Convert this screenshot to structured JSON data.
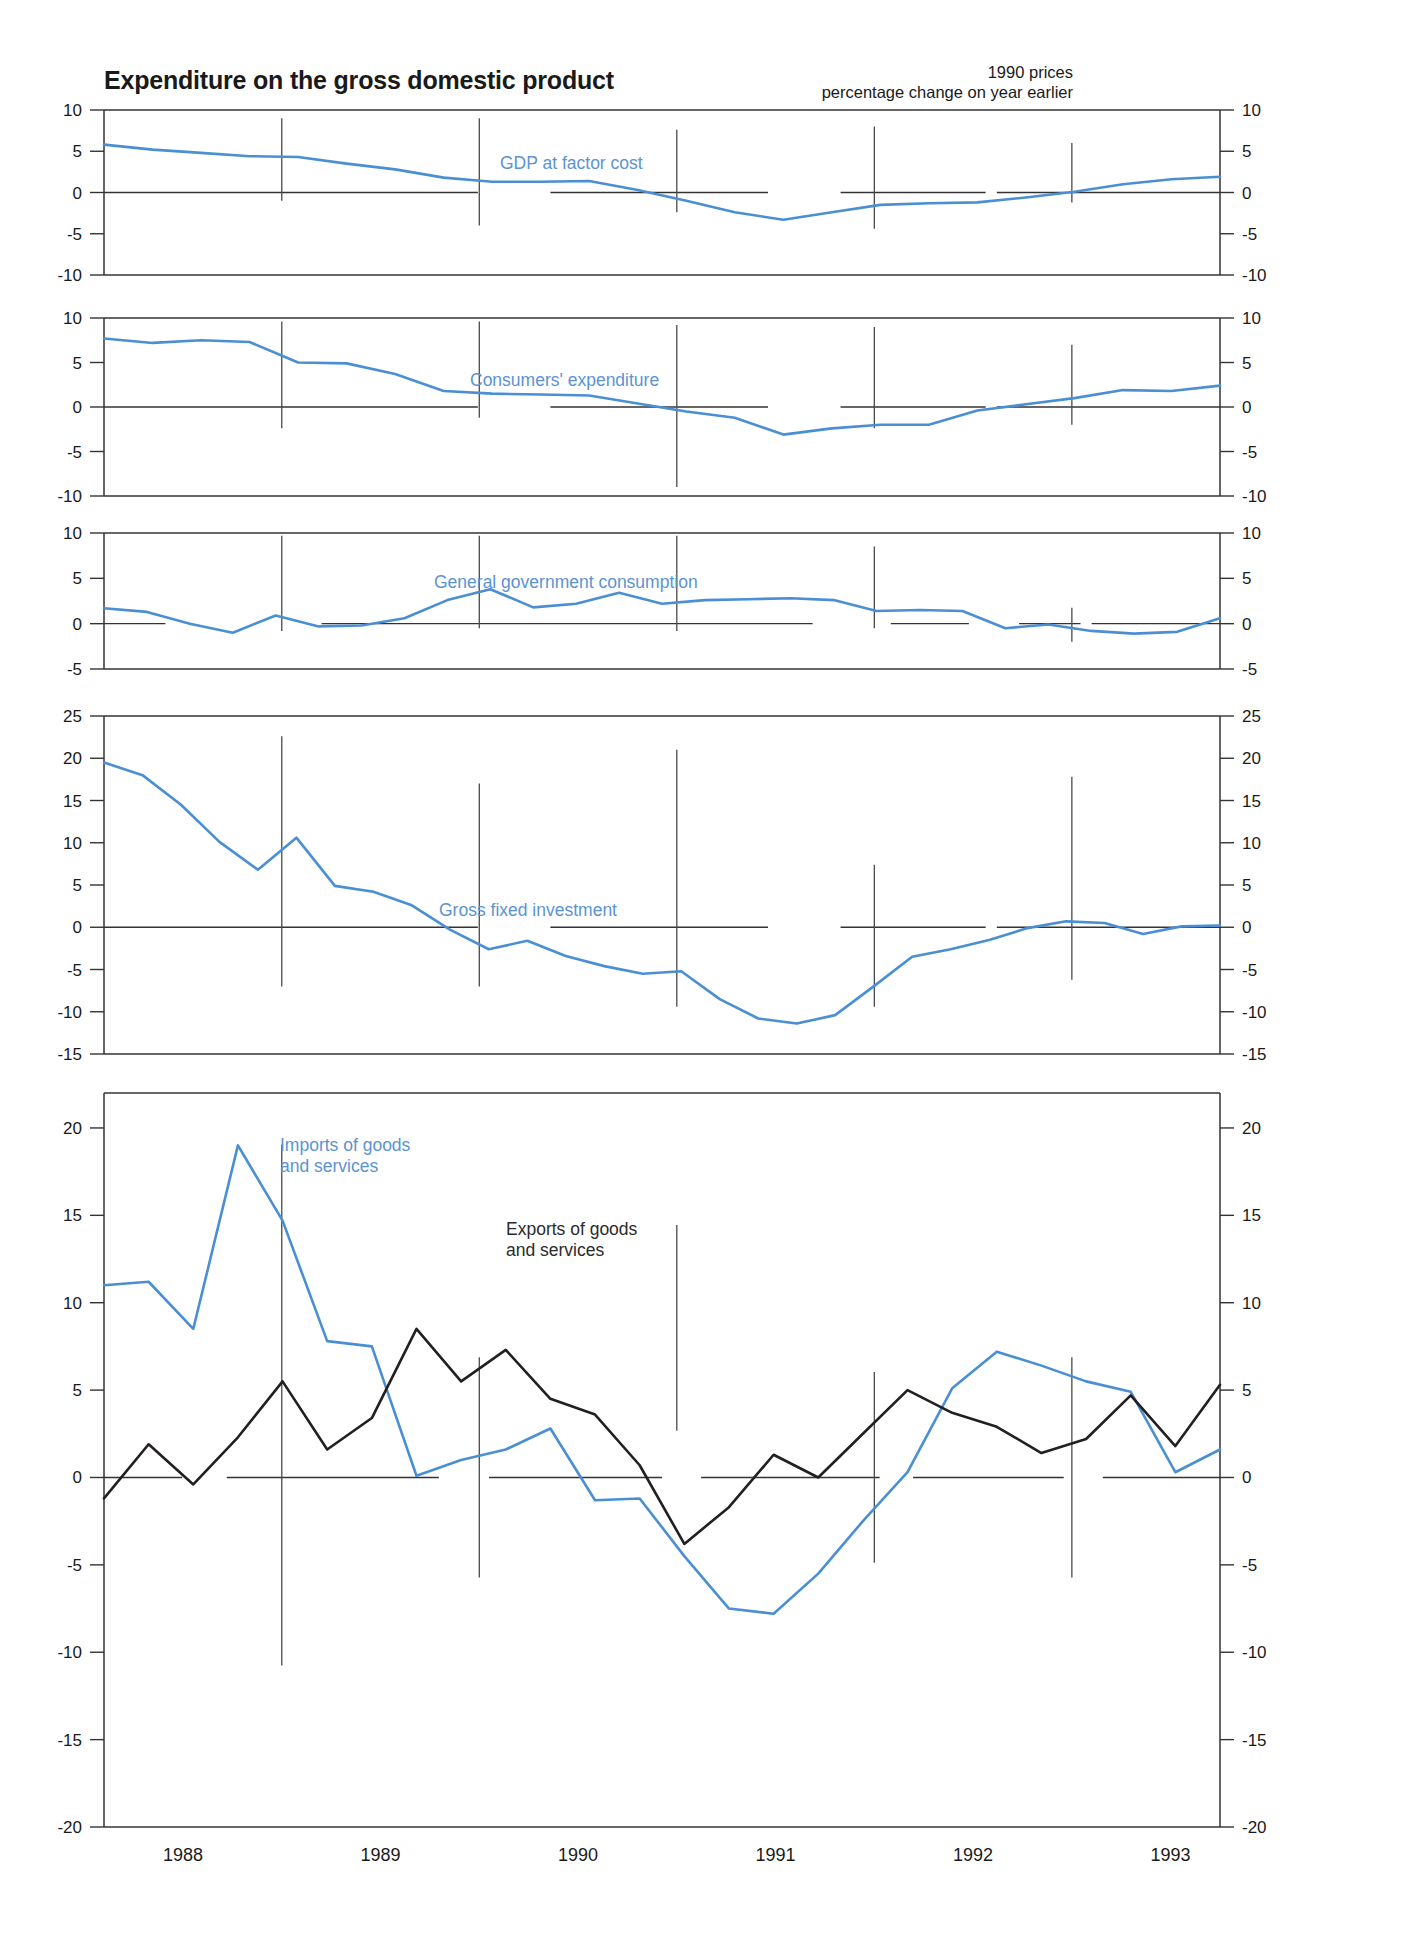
{
  "header": {
    "title": "Expenditure on the gross domestic product",
    "unit_line1": "1990 prices",
    "unit_line2": "percentage change on year earlier"
  },
  "axis": {
    "x_tick_labels": [
      "1988",
      "1989",
      "1990",
      "1991",
      "1992",
      "1993"
    ],
    "x_tick_values": [
      1988,
      1989,
      1990,
      1991,
      1992,
      1993
    ]
  },
  "colors": {
    "series_blue": "#4a8fd4",
    "series_black": "#231f20",
    "axis": "#333333",
    "label_blue": "#5b93d3"
  },
  "chart_data": {
    "type": "line",
    "title": "Expenditure on the gross domestic product",
    "subtitle": "1990 prices, percentage change on year earlier",
    "xlabel": "",
    "ylabel": "percentage change on year earlier",
    "xlim": [
      1987.6,
      1993.25
    ],
    "grid": false,
    "legend_position": "inline-annotation",
    "x_tick_labels": [
      "1988",
      "1989",
      "1990",
      "1991",
      "1992",
      "1993"
    ],
    "panels": [
      {
        "name": "gdp-at-factor-cost",
        "label": "GDP at factor cost",
        "label_color": "#5b93d3",
        "ylim": [
          -10,
          10
        ],
        "yticks": [
          -10,
          -5,
          0,
          5,
          10
        ],
        "series": [
          {
            "name": "GDP at factor cost",
            "color": "#4a8fd4",
            "x": [
              1987.6,
              1987.85,
              1988.1,
              1988.35,
              1988.6,
              1988.85,
              1989.1,
              1989.35,
              1989.6,
              1989.85,
              1990.1,
              1990.35,
              1990.6,
              1990.85,
              1991.1,
              1991.35,
              1991.6,
              1991.85,
              1992.1,
              1992.35,
              1992.6,
              1992.85,
              1993.1
            ],
            "values": [
              5.8,
              5.2,
              4.8,
              4.4,
              4.3,
              3.5,
              2.8,
              1.8,
              1.3,
              1.3,
              1.4,
              0.3,
              -1.0,
              -2.4,
              -3.3,
              -2.4,
              -1.5,
              -1.3,
              -1.2,
              -0.6,
              0.1,
              1.0,
              1.6,
              1.9
            ]
          }
        ]
      },
      {
        "name": "consumers-expenditure",
        "label": "Consumers' expenditure",
        "label_color": "#5b93d3",
        "ylim": [
          -10,
          10
        ],
        "yticks": [
          -10,
          -5,
          0,
          5,
          10
        ],
        "series": [
          {
            "name": "Consumers' expenditure",
            "color": "#4a8fd4",
            "x": [
              1987.6,
              1987.85,
              1988.1,
              1988.35,
              1988.6,
              1988.85,
              1989.1,
              1989.35,
              1989.6,
              1989.85,
              1990.1,
              1990.35,
              1990.6,
              1990.85,
              1991.1,
              1991.35,
              1991.6,
              1991.85,
              1992.1,
              1992.35,
              1992.6,
              1992.85,
              1993.1
            ],
            "values": [
              7.7,
              7.2,
              7.5,
              7.3,
              5.0,
              4.9,
              3.7,
              1.8,
              1.5,
              1.4,
              1.3,
              0.4,
              -0.5,
              -1.2,
              -3.1,
              -2.4,
              -2.0,
              -2.0,
              -0.4,
              0.3,
              1.0,
              1.9,
              1.8,
              2.4
            ]
          }
        ]
      },
      {
        "name": "general-government-consumption",
        "label": "General government consumption",
        "label_color": "#5b93d3",
        "ylim": [
          -5,
          10
        ],
        "yticks": [
          -5,
          0,
          5,
          10
        ],
        "series": [
          {
            "name": "General government consumption",
            "color": "#4a8fd4",
            "x": [
              1987.6,
              1987.85,
              1988.1,
              1988.35,
              1988.6,
              1988.85,
              1989.1,
              1989.35,
              1989.6,
              1989.85,
              1990.1,
              1990.35,
              1990.6,
              1990.85,
              1991.1,
              1991.35,
              1991.6,
              1991.85,
              1992.1,
              1992.35,
              1992.6,
              1992.85,
              1993.1
            ],
            "values": [
              1.7,
              1.3,
              0.0,
              -1.0,
              0.9,
              -0.3,
              -0.2,
              0.6,
              2.6,
              3.8,
              1.8,
              2.2,
              3.4,
              2.2,
              2.6,
              2.7,
              2.8,
              2.6,
              1.4,
              1.5,
              1.4,
              -0.5,
              -0.1,
              -0.8,
              -1.1,
              -0.9,
              0.6
            ]
          }
        ]
      },
      {
        "name": "gross-fixed-investment",
        "label": "Gross fixed investment",
        "label_color": "#5b93d3",
        "ylim": [
          -15,
          25
        ],
        "yticks": [
          -15,
          -10,
          -5,
          0,
          5,
          10,
          15,
          20,
          25
        ],
        "series": [
          {
            "name": "Gross fixed investment",
            "color": "#4a8fd4",
            "x": [
              1987.6,
              1987.85,
              1988.1,
              1988.35,
              1988.6,
              1988.85,
              1989.1,
              1989.35,
              1989.6,
              1989.85,
              1990.1,
              1990.35,
              1990.6,
              1990.85,
              1991.1,
              1991.35,
              1991.6,
              1991.85,
              1992.1,
              1992.35,
              1992.6,
              1992.85,
              1993.1
            ],
            "values": [
              19.5,
              18.0,
              14.5,
              10.1,
              6.8,
              10.6,
              4.9,
              4.2,
              2.6,
              -0.3,
              -2.6,
              -1.6,
              -3.4,
              -4.6,
              -5.5,
              -5.2,
              -8.5,
              -10.8,
              -11.4,
              -10.4,
              -7.0,
              -3.5,
              -2.6,
              -1.5,
              -0.1,
              0.7,
              0.5,
              -0.8,
              0.1,
              0.2
            ]
          }
        ]
      },
      {
        "name": "trade-in-goods-and-services",
        "label_imports": "Imports of goods\nand services",
        "label_exports": "Exports of goods\nand services",
        "ylim": [
          -20,
          22
        ],
        "yticks": [
          -20,
          -15,
          -10,
          -5,
          0,
          5,
          10,
          15,
          20
        ],
        "series": [
          {
            "name": "Imports of goods and services",
            "color": "#4a8fd4",
            "x": [
              1987.6,
              1987.85,
              1988.1,
              1988.35,
              1988.6,
              1988.85,
              1989.1,
              1989.35,
              1989.6,
              1989.85,
              1990.1,
              1990.35,
              1990.6,
              1990.85,
              1991.1,
              1991.35,
              1991.6,
              1991.85,
              1992.1,
              1992.35,
              1992.6,
              1992.85,
              1993.1
            ],
            "values": [
              11.0,
              11.2,
              8.5,
              19.0,
              14.7,
              7.8,
              7.5,
              0.1,
              1.0,
              1.6,
              2.8,
              -1.3,
              -1.2,
              -4.5,
              -7.5,
              -7.8,
              -5.5,
              -2.5,
              0.3,
              5.1,
              7.2,
              6.4,
              5.5,
              4.9,
              0.3,
              1.6
            ]
          },
          {
            "name": "Exports of goods and services",
            "color": "#231f20",
            "x": [
              1987.6,
              1987.85,
              1988.1,
              1988.35,
              1988.6,
              1988.85,
              1989.1,
              1989.35,
              1989.6,
              1989.85,
              1990.1,
              1990.35,
              1990.6,
              1990.85,
              1991.1,
              1991.35,
              1991.6,
              1991.85,
              1992.1,
              1992.35,
              1992.6,
              1992.85,
              1993.1
            ],
            "values": [
              -1.2,
              1.9,
              -0.4,
              2.3,
              5.5,
              1.6,
              3.4,
              8.5,
              5.5,
              7.3,
              4.5,
              3.6,
              0.7,
              -3.8,
              -1.7,
              1.3,
              0.0,
              2.5,
              5.0,
              3.7,
              2.9,
              1.4,
              2.2,
              4.7,
              1.8,
              5.3
            ]
          }
        ]
      }
    ]
  }
}
